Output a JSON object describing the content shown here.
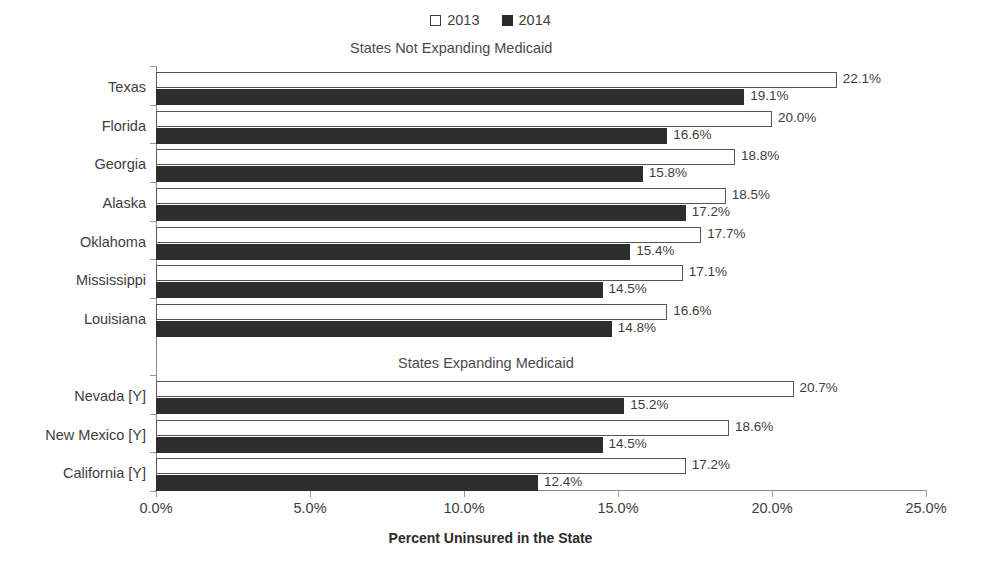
{
  "chart_data": {
    "type": "bar",
    "orientation": "horizontal",
    "title": "",
    "xlabel": "Percent Uninsured in the State",
    "ylabel": "",
    "xlim": [
      0,
      25
    ],
    "xticks": [
      "0.0%",
      "5.0%",
      "10.0%",
      "15.0%",
      "20.0%",
      "25.0%"
    ],
    "xtick_values": [
      0,
      5,
      10,
      15,
      20,
      25
    ],
    "grid": false,
    "legend_position": "top-center",
    "legend": [
      {
        "label": "2013",
        "swatch": "hollow"
      },
      {
        "label": "2014",
        "swatch": "solid"
      }
    ],
    "series": [
      {
        "name": "2013",
        "values": [
          22.1,
          20.0,
          18.8,
          18.5,
          17.7,
          17.1,
          16.6,
          20.7,
          18.6,
          17.2
        ]
      },
      {
        "name": "2014",
        "values": [
          19.1,
          16.6,
          15.8,
          17.2,
          15.4,
          14.5,
          14.8,
          15.2,
          14.5,
          12.4
        ]
      }
    ],
    "categories": [
      "Texas",
      "Florida",
      "Georgia",
      "Alaska",
      "Oklahoma",
      "Mississippi",
      "Louisiana",
      "Nevada [Y]",
      "New Mexico [Y]",
      "California [Y]"
    ],
    "groups": [
      {
        "heading": "States Not Expanding Medicaid",
        "rows": [
          {
            "category": "Texas",
            "v2013": 22.1,
            "v2014": 19.1,
            "label2013": "22.1%",
            "label2014": "19.1%"
          },
          {
            "category": "Florida",
            "v2013": 20.0,
            "v2014": 16.6,
            "label2013": "20.0%",
            "label2014": "16.6%"
          },
          {
            "category": "Georgia",
            "v2013": 18.8,
            "v2014": 15.8,
            "label2013": "18.8%",
            "label2014": "15.8%"
          },
          {
            "category": "Alaska",
            "v2013": 18.5,
            "v2014": 17.2,
            "label2013": "18.5%",
            "label2014": "17.2%"
          },
          {
            "category": "Oklahoma",
            "v2013": 17.7,
            "v2014": 15.4,
            "label2013": "17.7%",
            "label2014": "15.4%"
          },
          {
            "category": "Mississippi",
            "v2013": 17.1,
            "v2014": 14.5,
            "label2013": "17.1%",
            "label2014": "14.5%"
          },
          {
            "category": "Louisiana",
            "v2013": 16.6,
            "v2014": 14.8,
            "label2013": "16.6%",
            "label2014": "14.8%"
          }
        ]
      },
      {
        "heading": "States Expanding Medicaid",
        "rows": [
          {
            "category": "Nevada [Y]",
            "v2013": 20.7,
            "v2014": 15.2,
            "label2013": "20.7%",
            "label2014": "15.2%"
          },
          {
            "category": "New Mexico [Y]",
            "v2013": 18.6,
            "v2014": 14.5,
            "label2013": "18.6%",
            "label2014": "14.5%"
          },
          {
            "category": "California [Y]",
            "v2013": 17.2,
            "v2014": 12.4,
            "label2013": "17.2%",
            "label2014": "12.4%"
          }
        ]
      }
    ],
    "colors": {
      "series_2013_fill": "#ffffff",
      "series_2013_stroke": "#555555",
      "series_2014_fill": "#2e2e2e",
      "axis": "#8a8a8a",
      "text": "#3d3d3d",
      "background": "#ffffff"
    }
  }
}
